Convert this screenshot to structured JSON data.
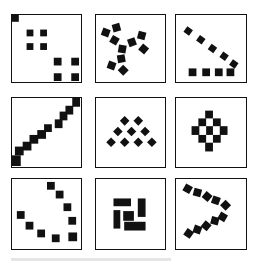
{
  "figure": {
    "layout": {
      "rows": 3,
      "cols": 3
    },
    "colors": {
      "ink": "#111111",
      "background": "#ffffff"
    },
    "panels": [
      {
        "id": "p1",
        "row": 0,
        "col": 0,
        "pattern": "corner-square-plus-two-2x2-clusters",
        "box": [
          11,
          14,
          71,
          69
        ],
        "shapes": [
          {
            "x": 0,
            "y": 0,
            "w": 7,
            "h": 7,
            "r": 0
          },
          {
            "x": 15,
            "y": 15,
            "w": 7,
            "h": 7,
            "r": 0
          },
          {
            "x": 29,
            "y": 15,
            "w": 7,
            "h": 7,
            "r": 0
          },
          {
            "x": 15,
            "y": 29,
            "w": 7,
            "h": 7,
            "r": 0
          },
          {
            "x": 29,
            "y": 29,
            "w": 7,
            "h": 7,
            "r": 0
          },
          {
            "x": 43,
            "y": 44,
            "w": 8,
            "h": 8,
            "r": 0
          },
          {
            "x": 61,
            "y": 44,
            "w": 8,
            "h": 8,
            "r": 0
          },
          {
            "x": 43,
            "y": 60,
            "w": 8,
            "h": 8,
            "r": 0
          },
          {
            "x": 61,
            "y": 60,
            "w": 8,
            "h": 8,
            "r": 0
          }
        ]
      },
      {
        "id": "p2",
        "row": 0,
        "col": 1,
        "pattern": "three-armed-pinwheel-of-rotated-squares",
        "box": [
          95,
          14,
          71,
          69
        ],
        "shapes": [
          {
            "x": 6,
            "y": 14,
            "w": 8,
            "h": 8,
            "r": 20
          },
          {
            "x": 17,
            "y": 9,
            "w": 8,
            "h": 8,
            "r": -15
          },
          {
            "x": 15,
            "y": 22,
            "w": 8,
            "h": 8,
            "r": 30
          },
          {
            "x": 23,
            "y": 31,
            "w": 8,
            "h": 8,
            "r": 10
          },
          {
            "x": 33,
            "y": 24,
            "w": 8,
            "h": 8,
            "r": -20
          },
          {
            "x": 43,
            "y": 17,
            "w": 8,
            "h": 8,
            "r": 15
          },
          {
            "x": 45,
            "y": 31,
            "w": 8,
            "h": 8,
            "r": 40
          },
          {
            "x": 22,
            "y": 41,
            "w": 8,
            "h": 8,
            "r": -10
          },
          {
            "x": 12,
            "y": 48,
            "w": 8,
            "h": 8,
            "r": 20
          },
          {
            "x": 24,
            "y": 53,
            "w": 8,
            "h": 8,
            "r": 45
          }
        ]
      },
      {
        "id": "p3",
        "row": 0,
        "col": 2,
        "pattern": "diagonal-line-and-horizontal-row",
        "box": [
          175,
          14,
          72,
          69
        ],
        "shapes": [
          {
            "x": 9,
            "y": 13,
            "w": 7,
            "h": 7,
            "r": 35
          },
          {
            "x": 22,
            "y": 22,
            "w": 7,
            "h": 7,
            "r": 35
          },
          {
            "x": 34,
            "y": 31,
            "w": 7,
            "h": 7,
            "r": 35
          },
          {
            "x": 46,
            "y": 39,
            "w": 7,
            "h": 7,
            "r": 35
          },
          {
            "x": 56,
            "y": 47,
            "w": 7,
            "h": 7,
            "r": 35
          },
          {
            "x": 13,
            "y": 55,
            "w": 8,
            "h": 8,
            "r": 0
          },
          {
            "x": 27,
            "y": 55,
            "w": 8,
            "h": 8,
            "r": 0
          },
          {
            "x": 40,
            "y": 55,
            "w": 8,
            "h": 8,
            "r": 0
          },
          {
            "x": 52,
            "y": 55,
            "w": 8,
            "h": 8,
            "r": 0
          }
        ]
      },
      {
        "id": "p4",
        "row": 1,
        "col": 0,
        "pattern": "two-staircase-diagonals",
        "box": [
          11,
          97,
          71,
          71
        ],
        "shapes": [
          {
            "x": 0,
            "y": 59,
            "w": 9,
            "h": 11,
            "r": 0
          },
          {
            "x": 3,
            "y": 50,
            "w": 9,
            "h": 9,
            "r": 0
          },
          {
            "x": 11,
            "y": 45,
            "w": 9,
            "h": 9,
            "r": 0
          },
          {
            "x": 18,
            "y": 38,
            "w": 9,
            "h": 9,
            "r": 0
          },
          {
            "x": 26,
            "y": 33,
            "w": 9,
            "h": 9,
            "r": 0
          },
          {
            "x": 33,
            "y": 27,
            "w": 8,
            "h": 8,
            "r": 0
          },
          {
            "x": 44,
            "y": 22,
            "w": 8,
            "h": 9,
            "r": 0
          },
          {
            "x": 49,
            "y": 14,
            "w": 8,
            "h": 9,
            "r": 0
          },
          {
            "x": 55,
            "y": 8,
            "w": 8,
            "h": 9,
            "r": 0
          },
          {
            "x": 62,
            "y": 0,
            "w": 8,
            "h": 9,
            "r": 0
          }
        ]
      },
      {
        "id": "p5",
        "row": 1,
        "col": 1,
        "pattern": "triangular-array-of-diamonds",
        "box": [
          95,
          97,
          71,
          71
        ],
        "shapes": [
          {
            "x": 26,
            "y": 20,
            "w": 7,
            "h": 7,
            "r": 45
          },
          {
            "x": 40,
            "y": 20,
            "w": 7,
            "h": 7,
            "r": 45
          },
          {
            "x": 19,
            "y": 31,
            "w": 7,
            "h": 7,
            "r": 45
          },
          {
            "x": 33,
            "y": 31,
            "w": 7,
            "h": 7,
            "r": 45
          },
          {
            "x": 47,
            "y": 31,
            "w": 7,
            "h": 7,
            "r": 45
          },
          {
            "x": 12,
            "y": 42,
            "w": 7,
            "h": 7,
            "r": 45
          },
          {
            "x": 26,
            "y": 42,
            "w": 7,
            "h": 7,
            "r": 45
          },
          {
            "x": 40,
            "y": 42,
            "w": 7,
            "h": 7,
            "r": 45
          },
          {
            "x": 54,
            "y": 42,
            "w": 7,
            "h": 7,
            "r": 45
          }
        ]
      },
      {
        "id": "p6",
        "row": 1,
        "col": 2,
        "pattern": "diamond-cluster-of-squares",
        "box": [
          175,
          97,
          72,
          71
        ],
        "shapes": [
          {
            "x": 30,
            "y": 13,
            "w": 8,
            "h": 8,
            "r": 0
          },
          {
            "x": 23,
            "y": 21,
            "w": 8,
            "h": 8,
            "r": 0
          },
          {
            "x": 38,
            "y": 21,
            "w": 8,
            "h": 8,
            "r": 0
          },
          {
            "x": 16,
            "y": 29,
            "w": 8,
            "h": 9,
            "r": 0
          },
          {
            "x": 31,
            "y": 29,
            "w": 7,
            "h": 9,
            "r": 0
          },
          {
            "x": 45,
            "y": 29,
            "w": 8,
            "h": 9,
            "r": 0
          },
          {
            "x": 23,
            "y": 38,
            "w": 8,
            "h": 8,
            "r": 0
          },
          {
            "x": 38,
            "y": 38,
            "w": 8,
            "h": 8,
            "r": 0
          },
          {
            "x": 30,
            "y": 46,
            "w": 8,
            "h": 9,
            "r": 0
          }
        ]
      },
      {
        "id": "p7",
        "row": 2,
        "col": 0,
        "pattern": "v-shaped-arrangement-of-squares",
        "box": [
          11,
          178,
          71,
          72
        ],
        "shapes": [
          {
            "x": 36,
            "y": 3,
            "w": 8,
            "h": 8,
            "r": 0
          },
          {
            "x": 45,
            "y": 12,
            "w": 8,
            "h": 8,
            "r": 0
          },
          {
            "x": 53,
            "y": 25,
            "w": 8,
            "h": 8,
            "r": 0
          },
          {
            "x": 58,
            "y": 39,
            "w": 8,
            "h": 8,
            "r": 0
          },
          {
            "x": 58,
            "y": 55,
            "w": 9,
            "h": 9,
            "r": 0
          },
          {
            "x": 5,
            "y": 33,
            "w": 8,
            "h": 8,
            "r": 0
          },
          {
            "x": 14,
            "y": 44,
            "w": 8,
            "h": 8,
            "r": 0
          },
          {
            "x": 26,
            "y": 52,
            "w": 8,
            "h": 8,
            "r": 0
          },
          {
            "x": 41,
            "y": 57,
            "w": 8,
            "h": 8,
            "r": 0
          }
        ]
      },
      {
        "id": "p8",
        "row": 2,
        "col": 1,
        "pattern": "interlocking-rectangles-block",
        "box": [
          95,
          178,
          71,
          72
        ],
        "shapes": [
          {
            "x": 18,
            "y": 20,
            "w": 18,
            "h": 8,
            "r": 0
          },
          {
            "x": 43,
            "y": 20,
            "w": 8,
            "h": 19,
            "r": 0
          },
          {
            "x": 18,
            "y": 32,
            "w": 7,
            "h": 19,
            "r": 0
          },
          {
            "x": 28,
            "y": 33,
            "w": 11,
            "h": 10,
            "r": 0
          },
          {
            "x": 29,
            "y": 44,
            "w": 22,
            "h": 9,
            "r": 0
          }
        ]
      },
      {
        "id": "p9",
        "row": 2,
        "col": 2,
        "pattern": "chevron-of-rotated-squares",
        "box": [
          175,
          178,
          72,
          72
        ],
        "shapes": [
          {
            "x": 8,
            "y": 6,
            "w": 8,
            "h": 8,
            "r": 30
          },
          {
            "x": 18,
            "y": 10,
            "w": 8,
            "h": 8,
            "r": 15
          },
          {
            "x": 28,
            "y": 14,
            "w": 8,
            "h": 8,
            "r": 40
          },
          {
            "x": 37,
            "y": 18,
            "w": 8,
            "h": 8,
            "r": 20
          },
          {
            "x": 47,
            "y": 23,
            "w": 8,
            "h": 8,
            "r": 45
          },
          {
            "x": 9,
            "y": 52,
            "w": 8,
            "h": 8,
            "r": 35
          },
          {
            "x": 18,
            "y": 48,
            "w": 8,
            "h": 8,
            "r": 20
          },
          {
            "x": 27,
            "y": 44,
            "w": 8,
            "h": 8,
            "r": 40
          },
          {
            "x": 36,
            "y": 39,
            "w": 8,
            "h": 8,
            "r": 15
          },
          {
            "x": 44,
            "y": 35,
            "w": 8,
            "h": 8,
            "r": 30
          }
        ]
      }
    ]
  }
}
